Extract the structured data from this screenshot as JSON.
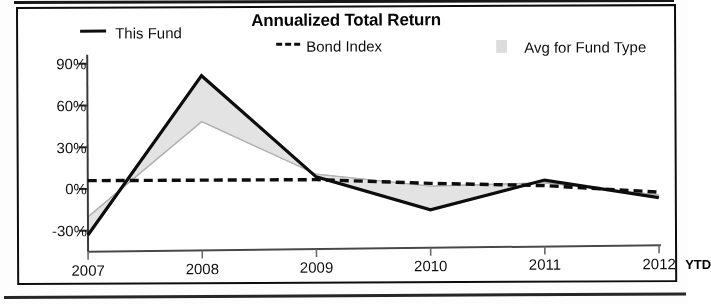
{
  "chart_data": {
    "type": "line",
    "title": "Annualized Total Return",
    "xlabel": "",
    "ylabel": "",
    "x": [
      "2007",
      "2008",
      "2009",
      "2010",
      "2011",
      "2012"
    ],
    "x_suffix_label": "YTD",
    "ylim": [
      -45,
      95
    ],
    "yticks": [
      90,
      60,
      30,
      0,
      -30
    ],
    "ytick_labels": [
      "90%",
      "60%",
      "30%",
      "0%",
      "-30%"
    ],
    "grid": false,
    "legend_position": "top",
    "series": [
      {
        "name": "This Fund",
        "style": "solid",
        "color": "#111111",
        "values": [
          -33,
          81,
          8,
          -16,
          5,
          -8
        ]
      },
      {
        "name": "Bond Index",
        "style": "dashed",
        "color": "#111111",
        "values": [
          6,
          6,
          6,
          3,
          1,
          -4
        ]
      },
      {
        "name": "Avg for Fund Type",
        "style": "filled-band",
        "color": "#d8d8d8",
        "values": [
          -20,
          48,
          10,
          1,
          3,
          -6
        ]
      }
    ]
  },
  "chart": {
    "title": "Annualized Total Return",
    "legend": [
      {
        "label": "This Fund",
        "swatch": "solid-line-swatch"
      },
      {
        "label": "Bond Index",
        "swatch": "dashed-line-swatch"
      },
      {
        "label": "Avg for Fund Type",
        "swatch": "shaded-area-swatch"
      }
    ],
    "y_axis": {
      "labels": [
        "90%",
        "60%",
        "30%",
        "0%",
        "-30%"
      ]
    },
    "x_axis": {
      "labels": [
        "2007",
        "2008",
        "2009",
        "2010",
        "2011",
        "2012"
      ],
      "suffix": "YTD"
    },
    "colors": {
      "line": "#111111",
      "band": "#d8d8d8",
      "frame": "#111111"
    }
  }
}
